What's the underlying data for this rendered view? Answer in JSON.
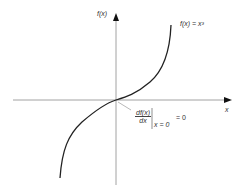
{
  "diagram": {
    "y_axis_label": "f(x)",
    "x_axis_label": "x",
    "curve_label": "f(x) = x³",
    "annotation": {
      "numerator": "df(x)",
      "denominator": "dx",
      "evaluated_at": "x = 0",
      "equals": "= 0"
    },
    "colors": {
      "axis": "#888888",
      "curve": "#222222",
      "text": "#333333"
    }
  }
}
